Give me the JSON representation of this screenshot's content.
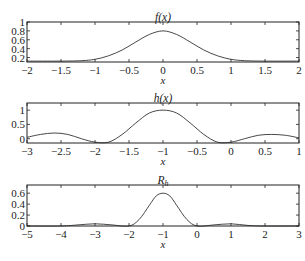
{
  "chart_data": [
    {
      "type": "line",
      "title": "f(x)",
      "xlabel": "x",
      "ylabel": "",
      "xlim": [
        -2,
        2
      ],
      "ylim": [
        0.1,
        1.0
      ],
      "xticks": [
        -2,
        -1.5,
        -1,
        -0.5,
        0,
        0.5,
        1,
        1.5,
        2
      ],
      "xtick_labels": [
        "−2",
        "−1.5",
        "−1",
        "−0.5",
        "0",
        "0.5",
        "1",
        "1.5",
        "2"
      ],
      "yticks": [
        0.2,
        0.4,
        0.6,
        0.8,
        1
      ],
      "ytick_labels": [
        "0.2",
        "0.4",
        "0.6",
        "0.8",
        "1"
      ],
      "grid": false,
      "series": [
        {
          "name": "f(x)",
          "x": [
            -2,
            -1.5,
            -1.2,
            -1,
            -0.8,
            -0.6,
            -0.4,
            -0.2,
            0,
            0.2,
            0.4,
            0.6,
            0.8,
            1,
            1.2,
            1.5,
            2
          ],
          "y": [
            0.12,
            0.12,
            0.13,
            0.16,
            0.24,
            0.37,
            0.55,
            0.72,
            0.8,
            0.72,
            0.55,
            0.37,
            0.24,
            0.16,
            0.13,
            0.12,
            0.12
          ]
        }
      ]
    },
    {
      "type": "line",
      "title": "h(x)",
      "xlabel": "x",
      "ylabel": "",
      "xlim": [
        -3,
        1
      ],
      "ylim": [
        -0.15,
        1.25
      ],
      "xticks": [
        -3,
        -2.5,
        -2,
        -1.5,
        -1,
        -0.5,
        0,
        0.5,
        1
      ],
      "xtick_labels": [
        "−3",
        "−2.5",
        "−2",
        "−1.5",
        "−1",
        "−0.5",
        "0",
        "0.5",
        "1"
      ],
      "yticks": [
        0,
        0.5,
        1
      ],
      "ytick_labels": [
        "0",
        "0.5",
        "1"
      ],
      "grid": false,
      "series": [
        {
          "name": "h(x)",
          "x": [
            -3,
            -2.8,
            -2.6,
            -2.4,
            -2.2,
            -2.0,
            -1.8,
            -1.6,
            -1.4,
            -1.2,
            -1.0,
            -0.8,
            -0.6,
            -0.4,
            -0.2,
            0,
            0.2,
            0.4,
            0.6,
            0.8,
            1
          ],
          "y": [
            0.05,
            0.15,
            0.2,
            0.15,
            0.0,
            -0.12,
            -0.12,
            0.15,
            0.55,
            0.9,
            1.0,
            0.9,
            0.55,
            0.15,
            -0.12,
            -0.12,
            0.0,
            0.12,
            0.15,
            0.12,
            0.03
          ]
        }
      ]
    },
    {
      "type": "line",
      "title": "R_h",
      "xlabel": "x",
      "ylabel": "",
      "xlim": [
        -5,
        3
      ],
      "ylim": [
        0,
        0.75
      ],
      "xticks": [
        -5,
        -4,
        -3,
        -2,
        -1,
        0,
        1,
        2,
        3
      ],
      "xtick_labels": [
        "−5",
        "−4",
        "−3",
        "−2",
        "−1",
        "0",
        "1",
        "2",
        "3"
      ],
      "yticks": [
        0,
        0.2,
        0.4,
        0.6
      ],
      "ytick_labels": [
        "0",
        "0.2",
        "0.4",
        "0.6"
      ],
      "grid": false,
      "series": [
        {
          "name": "R_h",
          "x": [
            -5,
            -4,
            -3.5,
            -3,
            -2.5,
            -2,
            -1.7,
            -1.4,
            -1.2,
            -1,
            -0.8,
            -0.6,
            -0.3,
            0,
            0.5,
            1,
            1.5,
            2,
            3
          ],
          "y": [
            0.0,
            0.0,
            0.02,
            0.04,
            0.02,
            0.0,
            0.12,
            0.38,
            0.55,
            0.6,
            0.55,
            0.38,
            0.12,
            0.0,
            0.02,
            0.04,
            0.01,
            0.0,
            0.0
          ]
        }
      ]
    }
  ]
}
